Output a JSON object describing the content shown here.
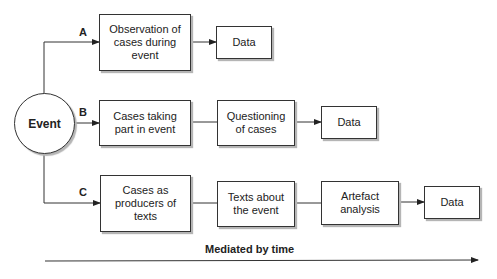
{
  "diagram": {
    "center_node": {
      "label": "Event"
    },
    "branches": [
      {
        "id": "A",
        "label": "A",
        "nodes": [
          "Observation of\ncases during\nevent",
          "Data"
        ]
      },
      {
        "id": "B",
        "label": "B",
        "nodes": [
          "Cases taking\npart in event",
          "Questioning\nof cases",
          "Data"
        ]
      },
      {
        "id": "C",
        "label": "C",
        "nodes": [
          "Cases as\nproducers of\ntexts",
          "Texts about\nthe event",
          "Artefact\nanalysis",
          "Data"
        ]
      }
    ],
    "time_axis": {
      "label": "Mediated by time"
    }
  }
}
